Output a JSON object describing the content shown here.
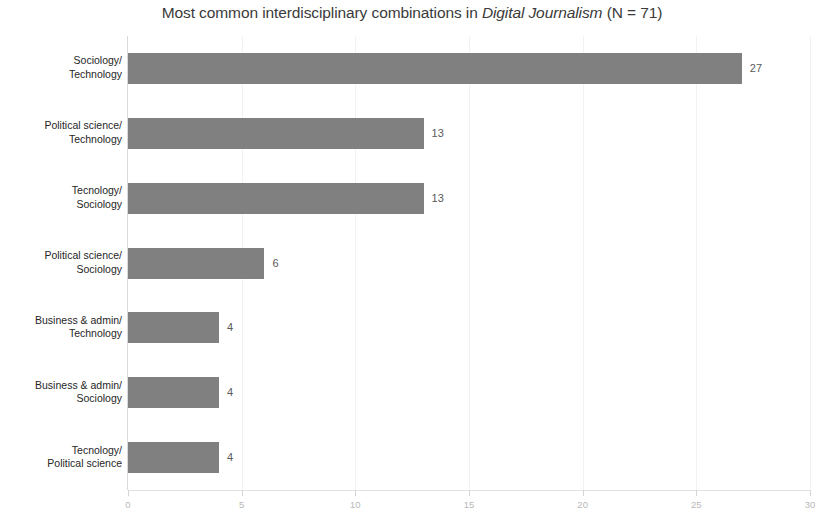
{
  "chart_data": {
    "type": "bar",
    "orientation": "horizontal",
    "title_parts": {
      "before": "Most common interdisciplinary combinations in ",
      "emphasis": "Digital Journalism",
      "after": " (N = 71)"
    },
    "title": "Most common interdisciplinary combinations in Digital Journalism (N = 71)",
    "xlabel": "",
    "ylabel": "",
    "xlim": [
      0,
      30
    ],
    "xticks": [
      0,
      5,
      10,
      15,
      20,
      25,
      30
    ],
    "xtick_labels": [
      "0",
      "5",
      "10",
      "15",
      "20",
      "25",
      "30"
    ],
    "grid": true,
    "legend": false,
    "bar_color": "#808080",
    "categories": [
      "Sociology/ Technology",
      "Political science/ Technology",
      "Tecnology/ Sociology",
      "Political science/ Sociology",
      "Business & admin/ Technology",
      "Business & admin/ Sociology",
      "Tecnology/ Political science"
    ],
    "category_lines": [
      [
        "Sociology/",
        "Technology"
      ],
      [
        "Political science/",
        "Technology"
      ],
      [
        "Tecnology/",
        "Sociology"
      ],
      [
        "Political science/",
        "Sociology"
      ],
      [
        "Business & admin/",
        "Technology"
      ],
      [
        "Business & admin/",
        "Sociology"
      ],
      [
        "Tecnology/",
        "Political science"
      ]
    ],
    "values": [
      27,
      13,
      13,
      6,
      4,
      4,
      4
    ],
    "value_labels": [
      "27",
      "13",
      "13",
      "6",
      "4",
      "4",
      "4"
    ]
  }
}
